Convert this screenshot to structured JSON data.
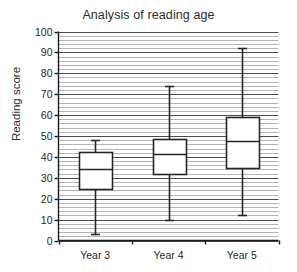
{
  "chart_data": {
    "type": "box",
    "title": "Analysis of reading age",
    "xlabel": "",
    "ylabel": "Reading score",
    "categories": [
      "Year 3",
      "Year 4",
      "Year 5"
    ],
    "ylim": [
      0,
      100
    ],
    "y_tick_labels": [
      "100",
      "90",
      "80",
      "70",
      "60",
      "50",
      "40",
      "30",
      "20",
      "10",
      "0"
    ],
    "y_tick_values": [
      100,
      90,
      80,
      70,
      60,
      50,
      40,
      30,
      20,
      10,
      0
    ],
    "y_major_step": 10,
    "y_minor_step": 2,
    "grid": "horizontal",
    "legend": "none",
    "series": [
      {
        "name": "Year 3",
        "min": 3,
        "q1": 24.5,
        "median": 34,
        "q3": 42.5,
        "max": 48
      },
      {
        "name": "Year 4",
        "min": 10,
        "q1": 32,
        "median": 41.5,
        "q3": 48.5,
        "max": 74
      },
      {
        "name": "Year 5",
        "min": 12,
        "q1": 34.5,
        "median": 47.5,
        "q3": 59,
        "max": 92
      }
    ],
    "colors": {
      "box_fill": "#ffffff",
      "box_stroke": "#262626",
      "grid_major": "#4d4d4d",
      "grid_minor": "#b5b5b5",
      "axis": "#1a1a1a",
      "background": "#ffffff"
    }
  }
}
